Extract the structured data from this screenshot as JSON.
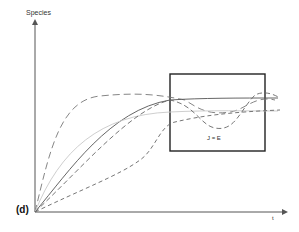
{
  "figure": {
    "panel_label": "(d)",
    "y_axis_label": "Species",
    "x_axis_label": "t",
    "box_label": "J = E"
  },
  "colors": {
    "axis": "#555555",
    "curve": "#666666",
    "light_curve": "#bbbbbb",
    "box": "#222222"
  },
  "curves": [
    {
      "name": "dash-long-fast",
      "style": "long-dash"
    },
    {
      "name": "solid",
      "style": "solid"
    },
    {
      "name": "light-solid",
      "style": "light"
    },
    {
      "name": "dash-medium",
      "style": "dash"
    },
    {
      "name": "dash-slow",
      "style": "short-dash"
    }
  ]
}
